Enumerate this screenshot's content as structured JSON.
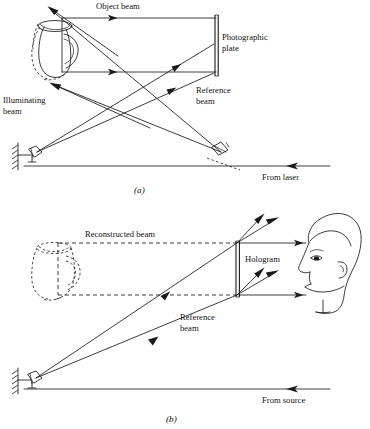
{
  "figure": {
    "background_color": "#ffffff",
    "ink_color": "#1a1a1a"
  },
  "panel_a": {
    "caption": "(a)",
    "labels": {
      "object_beam": "Object beam",
      "photographic_plate_line1": "Photographic",
      "photographic_plate_line2": "plate",
      "reference_beam_line1": "Reference",
      "reference_beam_line2": "beam",
      "illuminating_beam_line1": "Illuminating",
      "illuminating_beam_line2": "beam",
      "from_laser": "From laser"
    },
    "elements": {
      "object": "pitcher-half-dashed",
      "recording_medium": "photographic-plate",
      "left_optic": "wall-mounted-mirror",
      "right_optic": "beamsplitter"
    }
  },
  "panel_b": {
    "caption": "(b)",
    "labels": {
      "reconstructed_beam": "Reconstructed beam",
      "hologram": "Hologram",
      "reference_beam_line1": "Reference",
      "reference_beam_line2": "beam",
      "from_source": "From source"
    },
    "elements": {
      "virtual_object": "pitcher-dashed",
      "recording_medium": "hologram",
      "left_optic": "wall-mounted-mirror",
      "observer": "head-profile-left"
    }
  }
}
